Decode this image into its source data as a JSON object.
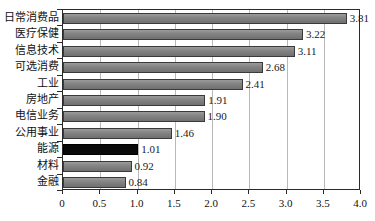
{
  "chart_data": {
    "type": "bar",
    "orientation": "horizontal",
    "title": "",
    "xlabel": "",
    "ylabel": "",
    "xlim": [
      0,
      4.0
    ],
    "xticks": [
      "0",
      "0.5",
      "1.0",
      "1.5",
      "2.0",
      "2.5",
      "3.0",
      "3.5",
      "4.0"
    ],
    "xtick_values": [
      0,
      0.5,
      1.0,
      1.5,
      2.0,
      2.5,
      3.0,
      3.5,
      4.0
    ],
    "grid": true,
    "legend": "none",
    "categories": [
      "日常消费品",
      "医疗保健",
      "信息技术",
      "可选消费",
      "工业",
      "房地产",
      "电信业务",
      "公用事业",
      "能源",
      "材料",
      "金融"
    ],
    "values": [
      3.81,
      3.22,
      3.11,
      2.68,
      2.41,
      1.91,
      1.9,
      1.46,
      1.01,
      0.92,
      0.84
    ],
    "value_labels": [
      "3.81",
      "3.22",
      "3.11",
      "2.68",
      "2.41",
      "1.91",
      "1.90",
      "1.46",
      "1.01",
      "0.92",
      "0.84"
    ],
    "highlight_index": 8,
    "highlight_category": "能源",
    "colors": {
      "bar": "#808080",
      "bar_highlight": "#0a0a0a",
      "bar_border": "#3a3a3a",
      "gridline": "#b9b9b9",
      "axis": "#2b2b2b",
      "text": "#111111",
      "background": "#ffffff"
    }
  }
}
